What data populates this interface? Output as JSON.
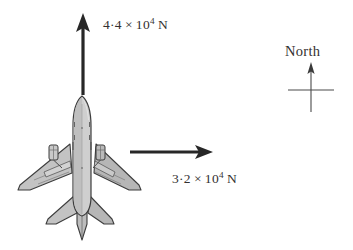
{
  "figure": {
    "type": "physics-force-diagram",
    "background_color": "#ffffff"
  },
  "labels": {
    "vertical_force": {
      "mantissa": "4·4",
      "times": "×",
      "base": "10",
      "exponent": "4",
      "unit": "N",
      "full_text": "4·4 × 10⁴ N",
      "value_newtons": 44000
    },
    "horizontal_force": {
      "mantissa": "3·2",
      "times": "×",
      "base": "10",
      "exponent": "4",
      "unit": "N",
      "full_text": "3·2 × 10⁴ N",
      "value_newtons": 32000
    },
    "compass": {
      "north_label": "North"
    }
  },
  "arrows": {
    "vertical": {
      "name": "upward-force-arrow",
      "direction": "up",
      "color": "#272727"
    },
    "horizontal": {
      "name": "rightward-force-arrow",
      "direction": "right",
      "color": "#272727"
    },
    "compass_needle": {
      "name": "north-arrow",
      "direction": "up",
      "color": "#3a3a3a"
    }
  },
  "aircraft": {
    "name": "airliner-top-view",
    "body_fill": "#bdbdbd",
    "body_fill_light": "#d2d2d2",
    "body_fill_dark": "#a8a8a8",
    "outline": "#3d3d3d",
    "detail": "#8f8f8f"
  },
  "colors": {
    "ink": "#2b2b2b",
    "arrow": "#272727",
    "compass": "#3a3a3a",
    "plane_light": "#d2d2d2",
    "plane_mid": "#bdbdbd",
    "plane_dark": "#a8a8a8",
    "plane_outline": "#3d3d3d"
  }
}
